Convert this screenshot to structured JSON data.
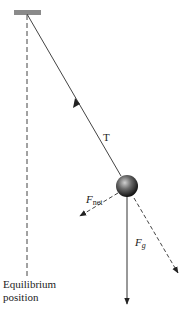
{
  "diagram": {
    "type": "pendulum-force-diagram",
    "labels": {
      "tension": "T",
      "net_force_main": "F",
      "net_force_sub": "net",
      "gravity_main": "F",
      "gravity_sub": "g",
      "equilibrium_line1": "Equilibrium",
      "equilibrium_line2": "position"
    },
    "colors": {
      "support": "#8a8a8a",
      "lines": "#333333",
      "bob_light": "#c8c8c8",
      "bob_dark": "#1a1a1a"
    },
    "elements": {
      "support_bar": "Fixed support",
      "string": "Pendulum string",
      "bob": "Pendulum bob",
      "equilibrium_line": "Dashed vertical equilibrium line",
      "tension_arrow": "Tension vector along string",
      "net_force_arrow": "Net force vector (dashed)",
      "gravity_arrow": "Gravitational force vector",
      "tangential_line": "Dashed tangential direction"
    }
  }
}
